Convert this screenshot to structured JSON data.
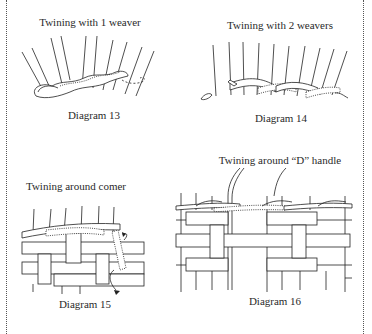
{
  "page": {
    "border_style": "dotted vertical rules on left and right",
    "colors": {
      "background": "#ffffff",
      "ink": "#222222"
    }
  },
  "diagrams": [
    {
      "id": 13,
      "title": "Twining with 1 weaver",
      "caption": "Diagram 13"
    },
    {
      "id": 14,
      "title": "Twining with 2 weavers",
      "caption": "Diagram 14"
    },
    {
      "id": 15,
      "title": "Twining around comer",
      "caption": "Diagram 15"
    },
    {
      "id": 16,
      "title": "Twining around “D” handle",
      "caption": "Diagram 16"
    }
  ]
}
